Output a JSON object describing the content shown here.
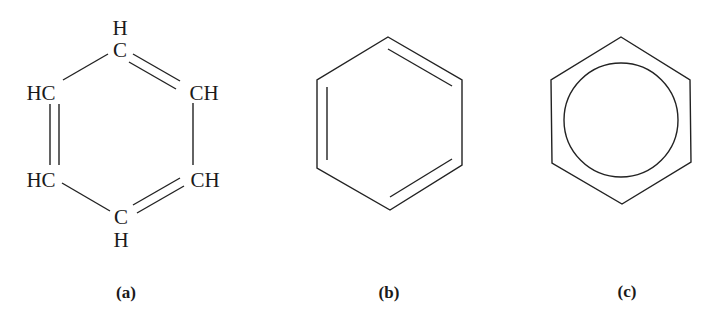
{
  "figure": {
    "structures": [
      {
        "id": "a",
        "caption": "(a)",
        "type": "Kekulé structure with explicit atoms",
        "atoms": {
          "top_h": "H",
          "top_c": "C",
          "upper_left": "HC",
          "upper_right": "CH",
          "lower_left": "HC",
          "lower_right": "CH",
          "bottom_c": "C",
          "bottom_h": "H"
        },
        "double_bonds": [
          "top-upper_right",
          "upper_left-lower_left",
          "lower_right-bottom"
        ]
      },
      {
        "id": "b",
        "caption": "(b)",
        "type": "Kekulé skeletal hexagon with alternating double bonds",
        "double_bonds": [
          "top-upper_right",
          "upper_left-lower_left",
          "lower_right-bottom"
        ]
      },
      {
        "id": "c",
        "caption": "(c)",
        "type": "Hexagon with inscribed circle (delocalized aromatic ring)"
      }
    ],
    "colors": {
      "ink": "#1a1a1a",
      "background": "#ffffff"
    }
  }
}
